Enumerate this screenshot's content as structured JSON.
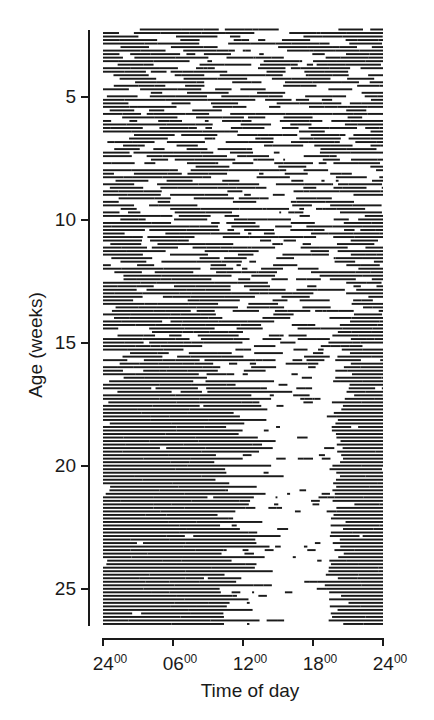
{
  "chart_data": {
    "type": "heatmap",
    "subtype": "actogram (single-plotted activity record)",
    "title": "",
    "xlabel": "Time of day",
    "ylabel": "Age (weeks)",
    "x_ticks": [
      {
        "hour": "24",
        "min": "00",
        "pos": 0
      },
      {
        "hour": "06",
        "min": "00",
        "pos": 6
      },
      {
        "hour": "12",
        "min": "00",
        "pos": 12
      },
      {
        "hour": "18",
        "min": "00",
        "pos": 18
      },
      {
        "hour": "24",
        "min": "00",
        "pos": 24
      }
    ],
    "xlim": [
      0,
      24
    ],
    "y_ticks": [
      5,
      10,
      15,
      20,
      25
    ],
    "ylim": [
      2.2,
      26.5
    ],
    "y_direction": "down",
    "grid": false,
    "legend": null,
    "activity_profile": {
      "description": "Dark horizontal bars mark activity per day. Weeks ~2-10: activity spread nearly uniformly across 24 h (ultradian). Weeks ~10-17: gradual consolidation. Weeks ~17-26: strong nocturnal pattern, dense activity ~19:00-08:00, sparse fragments ~09:00-18:00.",
      "weeks": [
        {
          "week": 3,
          "night_density": 0.55,
          "day_density": 0.5,
          "onset_hour": 20.5,
          "offset_hour": 8.0
        },
        {
          "week": 6,
          "night_density": 0.55,
          "day_density": 0.48,
          "onset_hour": 20.5,
          "offset_hour": 8.0
        },
        {
          "week": 9,
          "night_density": 0.5,
          "day_density": 0.4,
          "onset_hour": 20.0,
          "offset_hour": 8.5
        },
        {
          "week": 12,
          "night_density": 0.62,
          "day_density": 0.38,
          "onset_hour": 20.0,
          "offset_hour": 9.0
        },
        {
          "week": 15,
          "night_density": 0.7,
          "day_density": 0.3,
          "onset_hour": 20.0,
          "offset_hour": 9.0
        },
        {
          "week": 18,
          "night_density": 0.82,
          "day_density": 0.18,
          "onset_hour": 19.5,
          "offset_hour": 9.5
        },
        {
          "week": 21,
          "night_density": 0.88,
          "day_density": 0.13,
          "onset_hour": 19.5,
          "offset_hour": 9.5
        },
        {
          "week": 24,
          "night_density": 0.9,
          "day_density": 0.1,
          "onset_hour": 19.0,
          "offset_hour": 9.5
        },
        {
          "week": 26,
          "night_density": 0.92,
          "day_density": 0.1,
          "onset_hour": 19.0,
          "offset_hour": 9.5
        }
      ],
      "days_plotted": 170,
      "bar_color": "#1a1a1a"
    }
  }
}
